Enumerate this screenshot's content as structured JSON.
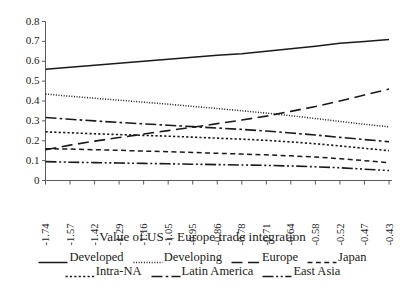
{
  "chart_data": {
    "type": "line",
    "title": "",
    "xlabel": "Value of US – Europe trade integration",
    "ylabel": "",
    "ylim": [
      0,
      0.8
    ],
    "ytick_labels": [
      "0.8",
      "0.7",
      "0.6",
      "0.5",
      "0.4",
      "0.3",
      "0.2",
      "0.1",
      "0"
    ],
    "ytick_values": [
      0.8,
      0.7,
      0.6,
      0.5,
      0.4,
      0.3,
      0.2,
      0.1,
      0
    ],
    "grid": false,
    "legend_position": "bottom",
    "categories": [
      "-1.74",
      "-1.57",
      "-1.42",
      "-1.29",
      "-1.16",
      "-1.05",
      "-0.95",
      "-0.86",
      "-0.78",
      "-0.71",
      "-0.64",
      "-0.58",
      "-0.52",
      "-0.47",
      "-0.43"
    ],
    "x": [
      -1.74,
      -1.57,
      -1.42,
      -1.29,
      -1.16,
      -1.05,
      -0.95,
      -0.86,
      -0.78,
      -0.71,
      -0.64,
      -0.58,
      -0.52,
      -0.47,
      -0.43
    ],
    "series": [
      {
        "name": "Developed",
        "line_style": "solid",
        "values": [
          0.56,
          0.57,
          0.58,
          0.59,
          0.6,
          0.61,
          0.62,
          0.63,
          0.638,
          0.65,
          0.663,
          0.676,
          0.69,
          0.7,
          0.71
        ]
      },
      {
        "name": "Developing",
        "line_style": "fine-dotted",
        "values": [
          0.435,
          0.424,
          0.414,
          0.404,
          0.394,
          0.384,
          0.373,
          0.362,
          0.351,
          0.339,
          0.326,
          0.312,
          0.297,
          0.283,
          0.27
        ]
      },
      {
        "name": "Europe",
        "line_style": "long-dash",
        "values": [
          0.155,
          0.178,
          0.198,
          0.216,
          0.234,
          0.251,
          0.268,
          0.286,
          0.304,
          0.324,
          0.348,
          0.372,
          0.4,
          0.43,
          0.46
        ]
      },
      {
        "name": "Japan",
        "line_style": "short-dash",
        "values": [
          0.16,
          0.158,
          0.155,
          0.152,
          0.148,
          0.145,
          0.141,
          0.137,
          0.133,
          0.129,
          0.124,
          0.118,
          0.11,
          0.1,
          0.09
        ]
      },
      {
        "name": "Intra-NA",
        "line_style": "dotted",
        "values": [
          0.245,
          0.24,
          0.235,
          0.231,
          0.227,
          0.223,
          0.218,
          0.213,
          0.208,
          0.202,
          0.194,
          0.185,
          0.174,
          0.162,
          0.15
        ]
      },
      {
        "name": "Latin America",
        "line_style": "dash-dot",
        "values": [
          0.317,
          0.308,
          0.3,
          0.292,
          0.285,
          0.278,
          0.271,
          0.264,
          0.257,
          0.249,
          0.239,
          0.229,
          0.217,
          0.206,
          0.195
        ]
      },
      {
        "name": "East Asia",
        "line_style": "dash-dot-dot",
        "values": [
          0.095,
          0.092,
          0.09,
          0.088,
          0.086,
          0.084,
          0.082,
          0.08,
          0.078,
          0.076,
          0.073,
          0.069,
          0.064,
          0.057,
          0.05
        ]
      }
    ]
  },
  "axis": {
    "xlabel": "Value of US – Europe trade integration"
  },
  "legend": {
    "row1": [
      {
        "label": "Developed",
        "style": "solid"
      },
      {
        "label": "Developing",
        "style": "fine-dotted"
      },
      {
        "label": "Europe",
        "style": "long-dash"
      },
      {
        "label": "Japan",
        "style": "short-dash"
      }
    ],
    "row2": [
      {
        "label": "Intra-NA",
        "style": "dotted"
      },
      {
        "label": "Latin America",
        "style": "dash-dot"
      },
      {
        "label": "East Asia",
        "style": "dash-dot-dot"
      }
    ]
  },
  "colors": {
    "ink": "#1a1a1a",
    "axis": "#4a4a4a",
    "background": "#ffffff"
  }
}
